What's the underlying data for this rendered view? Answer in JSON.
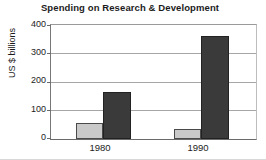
{
  "chart_data": {
    "type": "bar",
    "title": "Spending on Research & Development",
    "xlabel": "",
    "ylabel": "US $ billions",
    "categories": [
      "1980",
      "1990"
    ],
    "series": [
      {
        "name": "light-series",
        "values": [
          55,
          35
        ],
        "color": "#c9c9c9"
      },
      {
        "name": "dark-series",
        "values": [
          165,
          360
        ],
        "color": "#3a3a3a"
      }
    ],
    "ylim": [
      0,
      400
    ],
    "yticks": [
      0,
      100,
      200,
      300,
      400
    ],
    "ytick_labels": [
      "0",
      "100",
      "200",
      "300",
      "400"
    ],
    "grid": true,
    "legend": "none"
  },
  "axis": {
    "y_labels": {
      "t400": "400",
      "t300": "300",
      "t200": "200",
      "t100": "100",
      "t0": "0"
    },
    "x_labels": {
      "c0": "1980",
      "c1": "1990"
    }
  }
}
